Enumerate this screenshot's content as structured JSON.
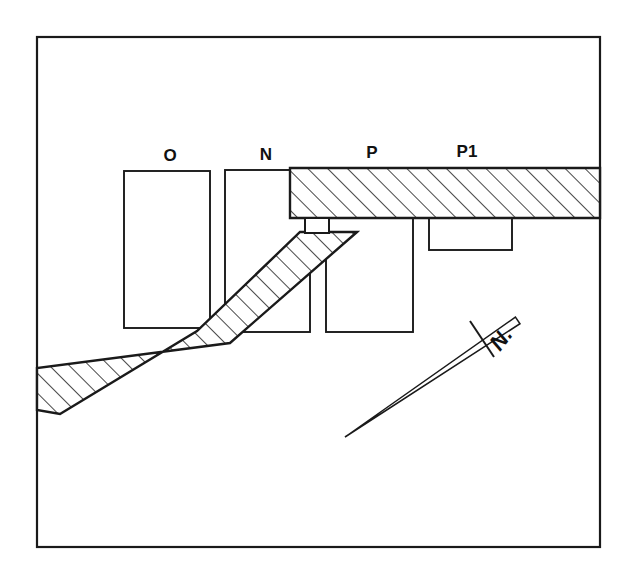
{
  "figure": {
    "kind": "line-drawing",
    "background_color": "#ffffff",
    "ink_color": "#1a1a1a",
    "frame": {
      "name": "border-frame",
      "x": 37,
      "y": 37,
      "width": 563,
      "height": 510,
      "stroke_width": 2.2
    },
    "labels": [
      {
        "id": "O",
        "text": "O",
        "x": 170,
        "y": 161
      },
      {
        "id": "N",
        "text": "N",
        "x": 266,
        "y": 160
      },
      {
        "id": "P",
        "text": "P",
        "x": 372,
        "y": 158
      },
      {
        "id": "P1",
        "text": "P1",
        "x": 467,
        "y": 157
      }
    ],
    "north_arrow": {
      "name": "north-arrow",
      "label": "N.",
      "label_x": 500,
      "label_y": 352,
      "label_rotation_deg": -52,
      "tip_x": 516,
      "tip_y": 318,
      "tail_x": 345,
      "tail_y": 437,
      "tick_from_x": 470,
      "tick_from_y": 321,
      "tick_to_x": 494,
      "tick_to_y": 357
    },
    "rectangles": [
      {
        "id": "rect-O",
        "label_ref": "O",
        "x": 124,
        "y": 171,
        "width": 86,
        "height": 157
      },
      {
        "id": "rect-N",
        "label_ref": "N",
        "x": 225,
        "y": 170,
        "width": 85,
        "height": 162
      },
      {
        "id": "rect-P",
        "label_ref": "P",
        "x": 326,
        "y": 218,
        "width": 87,
        "height": 114
      },
      {
        "id": "rect-P1",
        "label_ref": "P1",
        "x": 429,
        "y": 218,
        "width": 83,
        "height": 32
      }
    ],
    "hatched_bands": [
      {
        "id": "band-horizontal",
        "description": "horizontal hatched road band running to right frame edge",
        "points": "290,168 600,168 600,218 290,218",
        "hatch_angle_deg": 45
      },
      {
        "id": "band-diagonal",
        "description": "bent diagonal hatched road band descending to the left frame edge",
        "points": "357,232 230,343 37,368 37,410 60,414 197,331 300,232",
        "hatch_angle_deg": 45
      }
    ],
    "connectors": [
      {
        "id": "connector-stub",
        "description": "short vertical link between the horizontal band and diagonal band",
        "x": 305,
        "y": 218,
        "width": 24,
        "height": 15
      }
    ]
  }
}
